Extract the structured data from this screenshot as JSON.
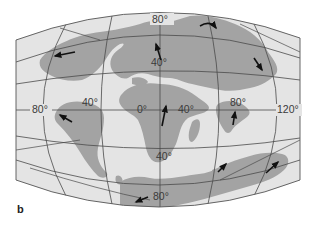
{
  "figure": {
    "panel_label": "b",
    "colors": {
      "ocean": "#e4e4e4",
      "land": "#a3a3a3",
      "grid": "#4a4a4a",
      "arrow": "#111111",
      "text": "#3a3a3a"
    }
  },
  "map": {
    "projection": "elliptical (Mollweide-like)",
    "latitude_labels": [
      {
        "text": "80°",
        "pos": "top"
      },
      {
        "text": "40°",
        "pos": "upper-center"
      },
      {
        "text": "40°",
        "pos": "lower-center"
      },
      {
        "text": "80°",
        "pos": "bottom"
      }
    ],
    "longitude_labels": [
      {
        "text": "80°",
        "pos": "west"
      },
      {
        "text": "40°",
        "pos": "west-center"
      },
      {
        "text": "0°",
        "pos": "center"
      },
      {
        "text": "40°",
        "pos": "east-center"
      },
      {
        "text": "80°",
        "pos": "east"
      },
      {
        "text": "120°",
        "pos": "far-east"
      }
    ],
    "arrows_count": 10
  }
}
